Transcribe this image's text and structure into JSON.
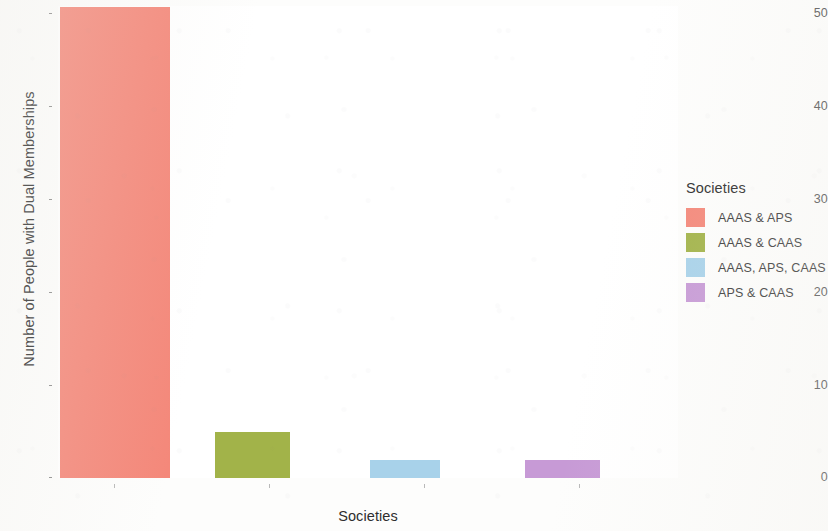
{
  "chart_data": {
    "type": "bar",
    "title": "",
    "xlabel": "Societies",
    "ylabel": "Number of People with Dual Memberships",
    "categories": [
      "AAAS & APS",
      "AAAS & CAAS",
      "AAAS, APS, CAAS",
      "APS & CAAS"
    ],
    "values": [
      51,
      5,
      2,
      2
    ],
    "colors": [
      "#f4887a",
      "#a2b349",
      "#a8d2ea",
      "#c79ad6"
    ],
    "ylim": [
      0,
      51
    ],
    "y_ticks": [
      0,
      10,
      20,
      30,
      40,
      50
    ],
    "y_tick_labels": [
      "0",
      "10",
      "20",
      "30",
      "40",
      "50"
    ],
    "x_tick_labels": [
      "",
      "",
      "",
      ""
    ],
    "grid": false,
    "legend_position": "right"
  },
  "legend": {
    "title": "Societies",
    "entries": [
      {
        "label": "AAAS & APS",
        "color": "#f4887a"
      },
      {
        "label": "AAAS & CAAS",
        "color": "#a2b349"
      },
      {
        "label": "AAAS, APS, CAAS",
        "color": "#a8d2ea"
      },
      {
        "label": "APS & CAAS",
        "color": "#c79ad6"
      }
    ]
  },
  "axes": {
    "y_title": "Number of People with Dual Memberships",
    "x_title": "Societies",
    "y_labels": [
      "50",
      "40",
      "30",
      "20",
      "10",
      "0"
    ]
  }
}
